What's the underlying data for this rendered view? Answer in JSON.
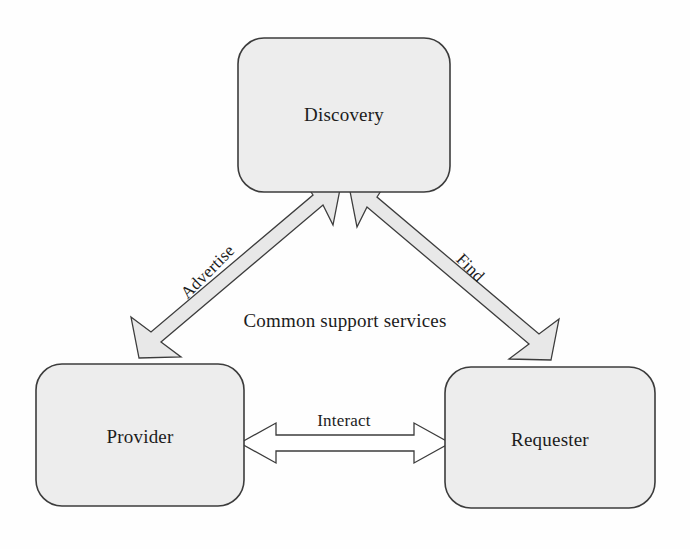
{
  "diagram": {
    "background_color": "#fefefe",
    "node_fill": "#ededed",
    "node_stroke": "#3c3c3c",
    "arrow_fill_diagonal": "#e6e6e6",
    "arrow_fill_horizontal": "#ffffff",
    "arrow_stroke": "#3c3c3c",
    "text_color": "#1c1c1c",
    "nodes": [
      {
        "id": "discovery",
        "label": "Discovery",
        "x": 238,
        "y": 38,
        "w": 212,
        "h": 154,
        "r": 26
      },
      {
        "id": "provider",
        "label": "Provider",
        "x": 36,
        "y": 364,
        "w": 208,
        "h": 142,
        "r": 26
      },
      {
        "id": "requester",
        "label": "Requester",
        "x": 445,
        "y": 367,
        "w": 210,
        "h": 141,
        "r": 26
      }
    ],
    "edges": [
      {
        "id": "advertise",
        "label": "Advertise",
        "from": "provider",
        "to": "discovery",
        "direction": "bidirectional",
        "style": "filled-gray"
      },
      {
        "id": "find",
        "label": "Find",
        "from": "requester",
        "to": "discovery",
        "direction": "bidirectional",
        "style": "filled-gray"
      },
      {
        "id": "interact",
        "label": "Interact",
        "from": "provider",
        "to": "requester",
        "direction": "bidirectional",
        "style": "outline-white"
      }
    ],
    "annotations": [
      {
        "id": "common-support",
        "text": "Common support services"
      }
    ]
  }
}
